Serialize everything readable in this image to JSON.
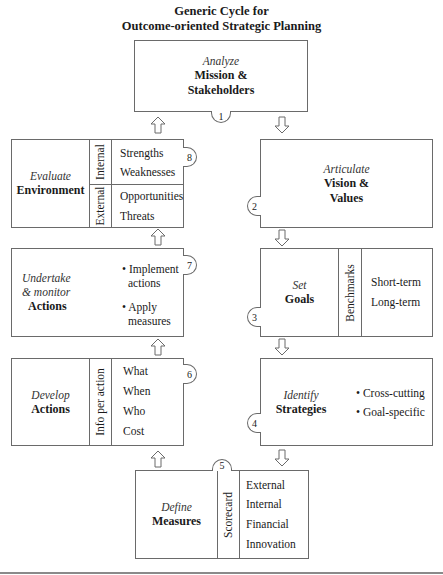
{
  "title": {
    "line1": "Generic Cycle for",
    "line2": "Outcome-oriented Strategic Planning"
  },
  "steps": [
    {
      "number": "1",
      "verb": "Analyze",
      "noun_line1": "Mission &",
      "noun_line2": "Stakeholders"
    },
    {
      "number": "2",
      "verb": "Articulate",
      "noun_line1": "Vision &",
      "noun_line2": "Values"
    },
    {
      "number": "3",
      "verb": "Set",
      "noun": "Goals",
      "side_label": "Benchmarks",
      "items": [
        "Short-term",
        "Long-term"
      ]
    },
    {
      "number": "4",
      "verb": "Identify",
      "noun": "Strategies",
      "items": [
        "• Cross-cutting",
        "• Goal-specific"
      ]
    },
    {
      "number": "5",
      "verb": "Define",
      "noun": "Measures",
      "side_label": "Scorecard",
      "items": [
        "External",
        "Internal",
        "Financial",
        "Innovation"
      ]
    },
    {
      "number": "6",
      "verb": "Develop",
      "noun": "Actions",
      "side_label": "Info per action",
      "items": [
        "What",
        "When",
        "Who",
        "Cost"
      ]
    },
    {
      "number": "7",
      "verb_line1": "Undertake",
      "verb_line2": "& monitor",
      "noun": "Actions",
      "items": [
        "• Implement",
        "actions",
        "• Apply",
        "measures"
      ]
    },
    {
      "number": "8",
      "verb": "Evaluate",
      "noun": "Environment",
      "groups": [
        {
          "label": "Internal",
          "items": [
            "Strengths",
            "Weaknesses"
          ]
        },
        {
          "label": "External",
          "items": [
            "Opportunities",
            "Threats"
          ]
        }
      ]
    }
  ],
  "arrows": {
    "stroke": "#6a6a6a",
    "fill": "#ffffff"
  },
  "colors": {
    "border": "#6a6a6a",
    "text": "#1a1a1a"
  }
}
